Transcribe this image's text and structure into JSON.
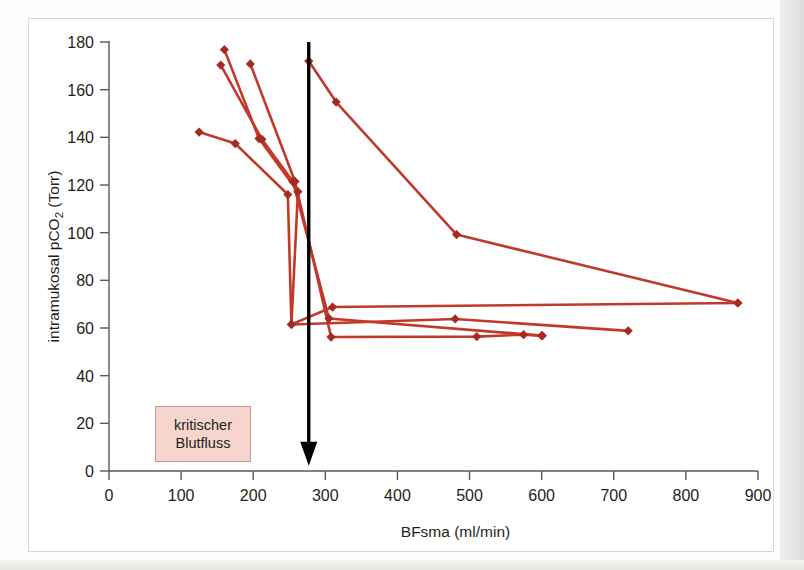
{
  "figure": {
    "annotation": {
      "line1": "kritischer",
      "line2": "Blutfluss",
      "box_fill": "#f6d5cd",
      "box_stroke": "#c49a90"
    },
    "marker_color": "#a62a22",
    "line_color": "#c0392b",
    "arrow_color": "#000000",
    "axis_color": "#58595b"
  },
  "chart_data": {
    "type": "line",
    "title": "",
    "xlabel": "BFsma (ml/min)",
    "ylabel": "intramukosal pCO2 (Torr)",
    "ylabel_parts": {
      "pre": "intramukosal pCO",
      "sub": "2",
      "post": " (Torr)"
    },
    "xlim": [
      0,
      900
    ],
    "ylim": [
      0,
      180
    ],
    "xticks": [
      0,
      100,
      200,
      300,
      400,
      500,
      600,
      700,
      800,
      900
    ],
    "yticks": [
      0,
      20,
      40,
      60,
      80,
      100,
      120,
      140,
      160,
      180
    ],
    "xtick_labels": [
      "0",
      "100",
      "200",
      "300",
      "400",
      "500",
      "600",
      "700",
      "800",
      "900"
    ],
    "ytick_labels": [
      "0",
      "20",
      "40",
      "60",
      "80",
      "100",
      "120",
      "140",
      "160",
      "180"
    ],
    "grid": false,
    "legend": null,
    "marker": "diamond",
    "annotations": [
      {
        "kind": "vertical-arrow",
        "x": 277,
        "y_top": 180,
        "y_bottom": 3,
        "label": "kritischer Blutfluss"
      },
      {
        "kind": "text-box",
        "text": "kritischer Blutfluss",
        "x": 60,
        "y": 22
      }
    ],
    "series": [
      {
        "name": "series-1",
        "points": [
          [
            125,
            142.2
          ],
          [
            175,
            137.4
          ],
          [
            248,
            116.0
          ],
          [
            253,
            61.5
          ],
          [
            310,
            68.8
          ],
          [
            872,
            70.5
          ]
        ]
      },
      {
        "name": "series-2",
        "points": [
          [
            160,
            176.8
          ],
          [
            208,
            139.5
          ],
          [
            262,
            117.2
          ],
          [
            253,
            61.5
          ],
          [
            480,
            63.8
          ],
          [
            720,
            58.8
          ]
        ]
      },
      {
        "name": "series-3",
        "points": [
          [
            155,
            170.3
          ],
          [
            212,
            139.2
          ],
          [
            255,
            121.5
          ],
          [
            305,
            64.0
          ],
          [
            600,
            56.8
          ]
        ]
      },
      {
        "name": "series-4",
        "points": [
          [
            196,
            170.8
          ],
          [
            258,
            121.5
          ],
          [
            308,
            56.2
          ],
          [
            510,
            56.4
          ],
          [
            575,
            57.2
          ],
          [
            601,
            56.8
          ]
        ]
      },
      {
        "name": "series-5",
        "points": [
          [
            277,
            172.0
          ],
          [
            315,
            154.8
          ],
          [
            482,
            99.2
          ],
          [
            872,
            70.5
          ]
        ]
      }
    ]
  }
}
